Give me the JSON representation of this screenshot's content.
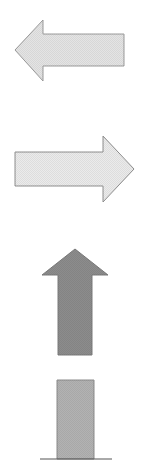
{
  "shapes": [
    {
      "name": "left-arrow",
      "direction": "left",
      "fill": "#e4e4e4",
      "stroke": "#9a9a9a",
      "points": "15,50 43,20 43,34 124,34 124,66 43,66 43,81"
    },
    {
      "name": "right-arrow",
      "direction": "right",
      "fill": "#ebebeb",
      "stroke": "#8e8e8e",
      "points": "15,152 103,152 103,136 134,169 103,202 103,186 15,186"
    },
    {
      "name": "up-arrow",
      "direction": "up",
      "fill": "#8c8c8c",
      "stroke": "#7a7a7a",
      "points": "75,249 108,275 92,275 92,355 58,355 58,275 42,275"
    },
    {
      "name": "bar-block",
      "direction": "none",
      "fill": "#b2b2b2",
      "stroke": "#8a8a8a",
      "points": "57,380 94,380 94,459 57,459"
    }
  ],
  "baseline": {
    "x1": 40,
    "x2": 112,
    "y": 459,
    "stroke": "#555555"
  }
}
